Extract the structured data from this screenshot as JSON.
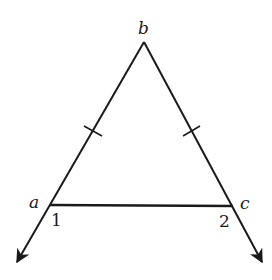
{
  "diagram": {
    "type": "isosceles triangle with extended base sides",
    "vertices": {
      "top": {
        "label": "b",
        "x": 144,
        "y": 42
      },
      "left": {
        "label": "a",
        "x": 50,
        "y": 205
      },
      "right": {
        "label": "c",
        "x": 233,
        "y": 206
      }
    },
    "angles": {
      "left": "1",
      "right": "2"
    },
    "tick_marks": "ab and bc marked congruent (single tick each)",
    "colors": {
      "line": "#1a1a1a",
      "background": "#ffffff"
    }
  }
}
